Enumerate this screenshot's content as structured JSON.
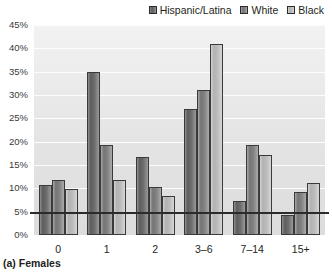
{
  "caption": "(a) Females",
  "legend": {
    "position": "top-right",
    "entries": [
      {
        "label": "Hispanic/Latina",
        "color": "#6e6e6e",
        "swatch_icon": "square-swatch-icon"
      },
      {
        "label": "White",
        "color": "#838383",
        "swatch_icon": "square-swatch-icon"
      },
      {
        "label": "Black",
        "color": "#bcbcbc",
        "swatch_icon": "square-swatch-icon"
      }
    ]
  },
  "chart_data": {
    "type": "bar",
    "title": "(a) Females",
    "xlabel": "",
    "ylabel": "",
    "ylim": [
      0,
      45
    ],
    "grid": true,
    "legend_position": "top-right",
    "categories": [
      "0",
      "1",
      "2",
      "3–6",
      "7–14",
      "15+"
    ],
    "ytick_labels": [
      "0%",
      "5%",
      "10%",
      "15%",
      "20%",
      "25%",
      "30%",
      "35%",
      "40%",
      "45%"
    ],
    "ytick_values": [
      0,
      5,
      10,
      15,
      20,
      25,
      30,
      35,
      40,
      45
    ],
    "series": [
      {
        "name": "Hispanic/Latina",
        "color": "#6e6e6e",
        "values": [
          10.8,
          35.0,
          16.8,
          27.0,
          7.2,
          4.2
        ]
      },
      {
        "name": "White",
        "color": "#838383",
        "values": [
          11.8,
          19.2,
          10.2,
          31.0,
          19.2,
          9.2
        ]
      },
      {
        "name": "Black",
        "color": "#bcbcbc",
        "values": [
          9.8,
          11.8,
          8.3,
          41.0,
          17.1,
          11.2
        ]
      }
    ]
  }
}
